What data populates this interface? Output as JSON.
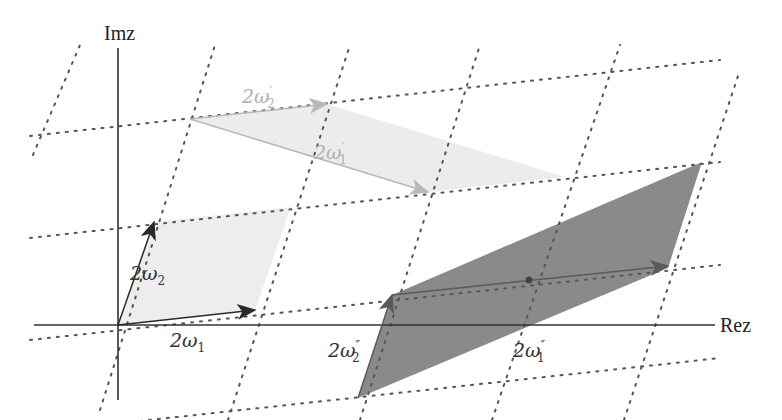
{
  "axes": {
    "x_label": "Rez",
    "y_label": "Imz",
    "origin": [
      118,
      325
    ]
  },
  "colors": {
    "axis": "#333333",
    "lattice": "#555555",
    "base_fill": "#ededed",
    "base_arrow": "#2a2a2a",
    "prime_fill": "#ececec",
    "prime_arrow": "#b8b8b8",
    "prime_text": "#b0b0b0",
    "dprime_fill": "#888888",
    "dprime_arrow": "#555555",
    "text": "#222222"
  },
  "lattice": {
    "omega1_step": [
      137,
      -15
    ],
    "omega2_step": [
      36,
      -103
    ]
  },
  "vectors": {
    "base": [
      {
        "id": "2w1",
        "label_main": "2ω",
        "label_sub": "1",
        "label_prime": ""
      },
      {
        "id": "2w2",
        "label_main": "2ω",
        "label_sub": "2",
        "label_prime": ""
      }
    ],
    "prime": [
      {
        "id": "2w1p",
        "label_main": "2ω",
        "label_sub": "1",
        "label_prime": "′"
      },
      {
        "id": "2w2p",
        "label_main": "2ω",
        "label_sub": "2",
        "label_prime": "′"
      }
    ],
    "double_prime": [
      {
        "id": "2w1pp",
        "label_main": "2ω",
        "label_sub": "1",
        "label_prime": "″"
      },
      {
        "id": "2w2pp",
        "label_main": "2ω",
        "label_sub": "2",
        "label_prime": "″"
      }
    ]
  }
}
